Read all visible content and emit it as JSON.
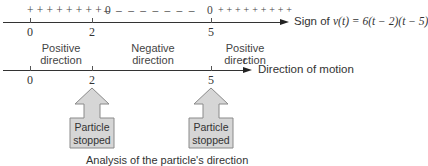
{
  "sign_axis": {
    "plus_left": "+ + + + + + + + 0",
    "minus_middle": "–  –  –  –  –  –  –  –",
    "zero_right": "0",
    "plus_right": "+ + + + + + + + +",
    "caption_prefix": "Sign of ",
    "caption_formula": "v(t) = 6(t − 2)(t − 5)",
    "ticks": [
      {
        "label": "0",
        "x": 30
      },
      {
        "label": "2",
        "x": 92
      },
      {
        "label": "5",
        "x": 211
      }
    ]
  },
  "motion_axis": {
    "variable": "t",
    "caption": "Direction of motion",
    "ticks": [
      {
        "label": "0",
        "x": 30
      },
      {
        "label": "2",
        "x": 92
      },
      {
        "label": "5",
        "x": 211
      }
    ],
    "intervals": [
      {
        "line1": "Positive",
        "line2": "direction"
      },
      {
        "line1": "Negative",
        "line2": "direction"
      },
      {
        "line1": "Positive",
        "line2": "direction"
      }
    ]
  },
  "stop_markers": [
    {
      "line1": "Particle",
      "line2": "stopped",
      "at_t": "2"
    },
    {
      "line1": "Particle",
      "line2": "stopped",
      "at_t": "5"
    }
  ],
  "caption": "Analysis of the particle's direction",
  "colors": {
    "axis": "#333333",
    "marker_fill": "#d6d6d6",
    "marker_stroke": "#888888",
    "text": "#333333"
  }
}
